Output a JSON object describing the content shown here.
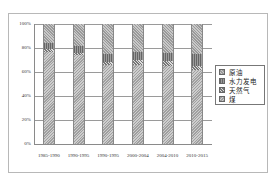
{
  "chart_data": {
    "type": "bar",
    "stacked": true,
    "percent_stacked": true,
    "title": "",
    "xlabel": "",
    "ylabel": "",
    "ylim": [
      0,
      100
    ],
    "grid": true,
    "legend_position": "right",
    "yticks": [
      "0%",
      "20%",
      "40%",
      "60%",
      "80%",
      "100%"
    ],
    "categories": [
      "1985-1990",
      "1990-1995",
      "1990-1995",
      "2000-2004",
      "2004-2010",
      "2010-2015"
    ],
    "series": [
      {
        "name": "煤",
        "values": [
          77,
          74,
          66,
          66,
          65,
          62
        ]
      },
      {
        "name": "天然气",
        "values": [
          2,
          2,
          2,
          4,
          4,
          3
        ]
      },
      {
        "name": "水力发电",
        "values": [
          5,
          6,
          7,
          7,
          7,
          10
        ]
      },
      {
        "name": "原油",
        "values": [
          16,
          18,
          25,
          23,
          24,
          25
        ]
      }
    ]
  },
  "legend": {
    "items": [
      {
        "label": "原油",
        "key": "oil"
      },
      {
        "label": "水力发电",
        "key": "hydro"
      },
      {
        "label": "天然气",
        "key": "gas"
      },
      {
        "label": "煤",
        "key": "coal"
      }
    ]
  }
}
